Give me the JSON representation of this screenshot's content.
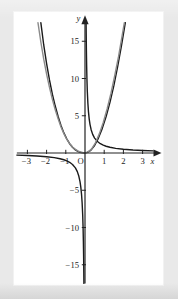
{
  "figure": {
    "background_color": "#e9e9e9",
    "panel_color": "#ffffff",
    "axis_color": "#222222"
  },
  "axis_labels": {
    "x": "x",
    "y": "y",
    "origin": "O"
  },
  "chart_data": {
    "type": "line",
    "title": "",
    "subtitle": "",
    "xlabel": "x",
    "ylabel": "y",
    "xlim": [
      -3.6,
      3.6
    ],
    "ylim": [
      -17.5,
      17.5
    ],
    "grid": false,
    "legend": "none",
    "x_ticks": [
      -3,
      -2,
      -1,
      1,
      2,
      3
    ],
    "x_tick_labels": [
      "-3",
      "-2",
      "-1",
      "1",
      "2",
      "3"
    ],
    "y_ticks": [
      15,
      10,
      5,
      -5,
      -10,
      -15
    ],
    "y_tick_labels": [
      "15",
      "10",
      "5",
      "-5",
      "-10",
      "-15"
    ],
    "origin_label": "O",
    "series": [
      {
        "name": "y = 1/x",
        "color": "#1a1a1a",
        "style": "solid",
        "width": 1.4,
        "branches": [
          {
            "name": "third-quadrant-branch",
            "points": [
              [
                -3.55,
                -0.28
              ],
              [
                -3.0,
                -0.333
              ],
              [
                -2.5,
                -0.4
              ],
              [
                -2.0,
                -0.5
              ],
              [
                -1.6,
                -0.625
              ],
              [
                -1.3,
                -0.77
              ],
              [
                -1.1,
                -0.91
              ],
              [
                -0.95,
                -1.05
              ],
              [
                -0.8,
                -1.25
              ],
              [
                -0.65,
                -1.54
              ],
              [
                -0.5,
                -2.0
              ],
              [
                -0.4,
                -2.5
              ],
              [
                -0.32,
                -3.13
              ],
              [
                -0.26,
                -3.85
              ],
              [
                -0.22,
                -4.55
              ],
              [
                -0.18,
                -5.56
              ],
              [
                -0.15,
                -6.67
              ],
              [
                -0.12,
                -8.33
              ],
              [
                -0.1,
                -10.0
              ],
              [
                -0.085,
                -11.8
              ],
              [
                -0.072,
                -13.9
              ],
              [
                -0.062,
                -16.1
              ],
              [
                -0.057,
                -17.5
              ]
            ]
          },
          {
            "name": "first-quadrant-branch",
            "points": [
              [
                0.057,
                17.5
              ],
              [
                0.062,
                16.1
              ],
              [
                0.072,
                13.9
              ],
              [
                0.085,
                11.8
              ],
              [
                0.1,
                10.0
              ],
              [
                0.12,
                8.33
              ],
              [
                0.15,
                6.67
              ],
              [
                0.18,
                5.56
              ],
              [
                0.22,
                4.55
              ],
              [
                0.26,
                3.85
              ],
              [
                0.32,
                3.13
              ],
              [
                0.4,
                2.5
              ],
              [
                0.5,
                2.0
              ],
              [
                0.65,
                1.54
              ],
              [
                0.8,
                1.25
              ],
              [
                0.95,
                1.05
              ],
              [
                1.1,
                0.91
              ],
              [
                1.3,
                0.77
              ],
              [
                1.6,
                0.625
              ],
              [
                2.0,
                0.5
              ],
              [
                2.5,
                0.4
              ],
              [
                3.0,
                0.333
              ],
              [
                3.55,
                0.28
              ]
            ]
          }
        ]
      },
      {
        "name": "steep-even-curve-dark",
        "color": "#1a1a1a",
        "style": "solid",
        "width": 1.4,
        "branches": [
          {
            "name": "u-shape-dark",
            "points": [
              [
                -2.3,
                17.5
              ],
              [
                -2.15,
                14.5
              ],
              [
                -2.0,
                12.0
              ],
              [
                -1.85,
                9.8
              ],
              [
                -1.7,
                7.9
              ],
              [
                -1.55,
                6.3
              ],
              [
                -1.4,
                4.9
              ],
              [
                -1.25,
                3.7
              ],
              [
                -1.1,
                2.7
              ],
              [
                -0.95,
                1.9
              ],
              [
                -0.8,
                1.25
              ],
              [
                -0.65,
                0.78
              ],
              [
                -0.5,
                0.42
              ],
              [
                -0.35,
                0.18
              ],
              [
                -0.2,
                0.06
              ],
              [
                -0.05,
                0.01
              ],
              [
                0.1,
                0.05
              ],
              [
                0.3,
                0.35
              ],
              [
                0.5,
                1.0
              ],
              [
                0.7,
                2.0
              ],
              [
                0.9,
                3.3
              ],
              [
                1.1,
                4.9
              ],
              [
                1.3,
                6.8
              ],
              [
                1.5,
                9.0
              ],
              [
                1.7,
                11.6
              ],
              [
                1.9,
                14.4
              ],
              [
                2.1,
                17.5
              ]
            ]
          }
        ]
      },
      {
        "name": "steep-even-curve-gray",
        "color": "#8a8a8a",
        "style": "solid",
        "width": 1.4,
        "branches": [
          {
            "name": "u-shape-gray",
            "points": [
              [
                -2.45,
                17.5
              ],
              [
                -2.3,
                14.9
              ],
              [
                -2.15,
                12.6
              ],
              [
                -2.0,
                10.6
              ],
              [
                -1.85,
                8.8
              ],
              [
                -1.7,
                7.2
              ],
              [
                -1.55,
                5.8
              ],
              [
                -1.4,
                4.6
              ],
              [
                -1.25,
                3.5
              ],
              [
                -1.1,
                2.6
              ],
              [
                -0.95,
                1.85
              ],
              [
                -0.8,
                1.25
              ],
              [
                -0.65,
                0.8
              ],
              [
                -0.5,
                0.48
              ],
              [
                -0.35,
                0.25
              ],
              [
                -0.2,
                0.1
              ],
              [
                -0.05,
                0.02
              ],
              [
                0.15,
                0.12
              ],
              [
                0.35,
                0.55
              ],
              [
                0.55,
                1.4
              ],
              [
                0.75,
                2.6
              ],
              [
                0.95,
                4.1
              ],
              [
                1.15,
                5.9
              ],
              [
                1.35,
                8.0
              ],
              [
                1.55,
                10.4
              ],
              [
                1.75,
                13.0
              ],
              [
                1.95,
                16.0
              ],
              [
                2.05,
                17.5
              ]
            ]
          }
        ]
      }
    ],
    "annotations": []
  }
}
